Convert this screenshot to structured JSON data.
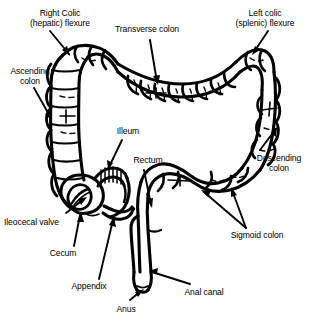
{
  "diagram": {
    "style": "black and white line drawing",
    "stroke_color": "#000000",
    "fill_color": "#ffffff",
    "background": "#ffffff",
    "labels": [
      {
        "id": "right-colic-flexure",
        "text": "Right Colic\n(hepatic) flexure",
        "x": 12,
        "y": 8,
        "width": 96,
        "align": "center"
      },
      {
        "id": "transverse-colon",
        "text": "Transverse colon",
        "x": 108,
        "y": 24,
        "width": 78,
        "align": "center"
      },
      {
        "id": "left-colic-flexure",
        "text": "Left colic\n(splenic) flexure",
        "x": 222,
        "y": 8,
        "width": 86,
        "align": "center"
      },
      {
        "id": "ascending-colon",
        "text": "Ascending\ncolon",
        "x": 3,
        "y": 66,
        "width": 54,
        "align": "center"
      },
      {
        "id": "illeum",
        "text": "Illeum",
        "x": 110,
        "y": 126,
        "width": 36,
        "align": "center"
      },
      {
        "id": "rectum",
        "text": "Rectum",
        "x": 128,
        "y": 155,
        "width": 40,
        "align": "center"
      },
      {
        "id": "descending-colon",
        "text": "Descending\ncolon",
        "x": 250,
        "y": 153,
        "width": 58,
        "align": "center"
      },
      {
        "id": "ileocecal-valve",
        "text": "Ileocecal valve",
        "x": 4,
        "y": 217,
        "width": 72,
        "align": "left"
      },
      {
        "id": "sigmoid-colon",
        "text": "Sigmoid colon",
        "x": 222,
        "y": 230,
        "width": 70,
        "align": "center"
      },
      {
        "id": "cecum",
        "text": "Cecum",
        "x": 44,
        "y": 248,
        "width": 38,
        "align": "center"
      },
      {
        "id": "appendix",
        "text": "Appendix",
        "x": 64,
        "y": 281,
        "width": 50,
        "align": "center"
      },
      {
        "id": "anal-canal",
        "text": "Anal canal",
        "x": 176,
        "y": 287,
        "width": 56,
        "align": "center"
      },
      {
        "id": "anus",
        "text": "Anus",
        "x": 110,
        "y": 304,
        "width": 32,
        "align": "center"
      }
    ],
    "structures": [
      "ascending colon",
      "transverse colon",
      "descending colon",
      "sigmoid colon",
      "cecum",
      "appendix",
      "ileum",
      "ileocecal valve",
      "rectum",
      "anal canal",
      "anus",
      "right colic (hepatic) flexure",
      "left colic (splenic) flexure"
    ]
  }
}
